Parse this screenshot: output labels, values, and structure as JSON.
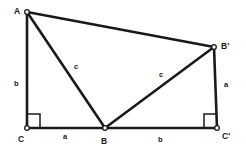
{
  "figure": {
    "background_color": "#ffffff",
    "stroke_color": "#1a1a1a",
    "width": 246,
    "height": 152,
    "vertices": [
      {
        "key": "A",
        "label": "A",
        "x": 27,
        "y": 12,
        "label_x": 14,
        "label_y": 7
      },
      {
        "key": "Bprime",
        "label": "B'",
        "x": 214,
        "y": 47,
        "label_x": 221,
        "label_y": 42
      },
      {
        "key": "C",
        "label": "C",
        "x": 27,
        "y": 128,
        "label_x": 18,
        "label_y": 135
      },
      {
        "key": "B",
        "label": "B",
        "x": 105,
        "y": 128,
        "label_x": 101,
        "label_y": 137
      },
      {
        "key": "Cprime",
        "label": "C'",
        "x": 217,
        "y": 128,
        "label_x": 222,
        "label_y": 132
      }
    ],
    "edges": [
      {
        "name": "edge-A-Bprime",
        "from": "A",
        "to": "Bprime"
      },
      {
        "name": "edge-A-C",
        "from": "A",
        "to": "C"
      },
      {
        "name": "edge-A-B",
        "from": "A",
        "to": "B"
      },
      {
        "name": "edge-C-B",
        "from": "C",
        "to": "B"
      },
      {
        "name": "edge-B-Cprime",
        "from": "B",
        "to": "Cprime"
      },
      {
        "name": "edge-B-Bprime",
        "from": "B",
        "to": "Bprime"
      },
      {
        "name": "edge-Bprime-Cprime",
        "from": "Bprime",
        "to": "Cprime"
      }
    ],
    "right_angles": [
      {
        "name": "right-angle-at-C",
        "at": "C",
        "x": 27,
        "y": 114,
        "size": 13,
        "opens": "right"
      },
      {
        "name": "right-angle-at-Cprime",
        "at": "Cprime",
        "x": 204,
        "y": 114,
        "size": 13,
        "opens": "left"
      }
    ],
    "side_labels": [
      {
        "name": "side-label-b-left",
        "text": "b",
        "x": 14,
        "y": 80
      },
      {
        "name": "side-label-c-left",
        "text": "c",
        "x": 74,
        "y": 63
      },
      {
        "name": "side-label-c-right",
        "text": "c",
        "x": 159,
        "y": 71
      },
      {
        "name": "side-label-a-right",
        "text": "a",
        "x": 224,
        "y": 81
      },
      {
        "name": "side-label-a-bottom",
        "text": "a",
        "x": 63,
        "y": 133
      },
      {
        "name": "side-label-b-bottom",
        "text": "b",
        "x": 158,
        "y": 136
      }
    ]
  }
}
